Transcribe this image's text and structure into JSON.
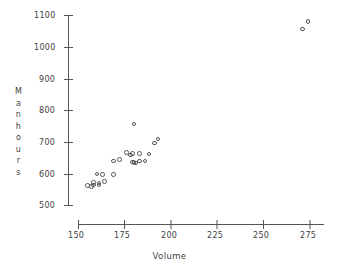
{
  "chart_data": {
    "type": "scatter",
    "title": "",
    "xlabel": "Volume",
    "ylabel": "Manhours",
    "xlim": [
      150,
      281
    ],
    "ylim": [
      487,
      1100
    ],
    "xticks": [
      150,
      175,
      200,
      225,
      250,
      275
    ],
    "yticks": [
      500,
      600,
      700,
      800,
      900,
      1000,
      1100
    ],
    "xtick_labels": [
      "150",
      "175",
      "200",
      "225",
      "250",
      "275"
    ],
    "ytick_labels": [
      "500",
      "600",
      "700",
      "800",
      "900",
      "1000",
      "1100"
    ],
    "grid": false,
    "legend": false,
    "marker": "open-circle",
    "marker_color": "#555555",
    "series": [
      {
        "name": "observations",
        "points": [
          [
            155,
            563
          ],
          [
            157,
            560
          ],
          [
            158,
            565
          ],
          [
            158,
            572
          ],
          [
            160,
            599
          ],
          [
            161,
            565
          ],
          [
            161,
            571
          ],
          [
            163,
            597
          ],
          [
            164,
            576
          ],
          [
            169,
            598
          ],
          [
            169,
            641
          ],
          [
            172,
            646
          ],
          [
            176,
            668
          ],
          [
            178,
            660
          ],
          [
            179,
            664
          ],
          [
            179,
            637
          ],
          [
            180,
            635
          ],
          [
            180,
            758
          ],
          [
            181,
            634
          ],
          [
            183,
            664
          ],
          [
            183,
            641
          ],
          [
            186,
            641
          ],
          [
            188,
            662
          ],
          [
            191,
            698
          ],
          [
            193,
            710
          ],
          [
            271,
            1057
          ],
          [
            274,
            1081
          ]
        ]
      }
    ]
  },
  "axes": {
    "y_title_chars": [
      "M",
      "a",
      "n",
      "h",
      "o",
      "u",
      "r",
      "s"
    ],
    "x_title": "Volume"
  },
  "colors": {
    "background": "#ffffff",
    "axis": "#555555",
    "text": "#3f3f3f",
    "marker": "#555555"
  }
}
